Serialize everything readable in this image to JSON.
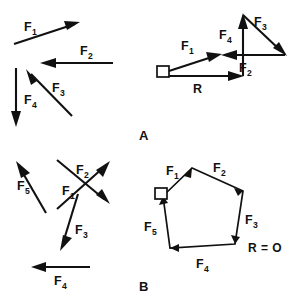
{
  "figure": {
    "panels": [
      {
        "id": "A",
        "label": "A",
        "caption": "A",
        "description": "Four concurrent force vectors and their tip-to-tail resultant",
        "resultant_label": "R",
        "resultant_value": "R",
        "vectors": [
          {
            "name": "F",
            "subscript": "1",
            "label": "F",
            "sub": "1"
          },
          {
            "name": "F",
            "subscript": "2",
            "label": "F",
            "sub": "2"
          },
          {
            "name": "F",
            "subscript": "3",
            "label": "F",
            "sub": "3"
          },
          {
            "name": "F",
            "subscript": "4",
            "label": "F",
            "sub": "4"
          }
        ]
      },
      {
        "id": "B",
        "label": "B",
        "caption": "B",
        "description": "Five force vectors forming a closed polygon, zero resultant",
        "resultant_label": "R = O",
        "resultant_value": "R = O",
        "vectors": [
          {
            "name": "F",
            "subscript": "1",
            "label": "F",
            "sub": "1"
          },
          {
            "name": "F",
            "subscript": "2",
            "label": "F",
            "sub": "2"
          },
          {
            "name": "F",
            "subscript": "3",
            "label": "F",
            "sub": "3"
          },
          {
            "name": "F",
            "subscript": "4",
            "label": "F",
            "sub": "4"
          },
          {
            "name": "F",
            "subscript": "5",
            "label": "F",
            "sub": "5"
          }
        ]
      }
    ],
    "labels": {
      "f1": "F",
      "f1_sub": "1",
      "f2": "F",
      "f2_sub": "2",
      "f3": "F",
      "f3_sub": "3",
      "f4": "F",
      "f4_sub": "4",
      "f5": "F",
      "f5_sub": "5",
      "r": "R",
      "r_zero": "R = O",
      "panel_a": "A",
      "panel_b": "B"
    },
    "colors": {
      "stroke": "#111111",
      "background": "#ffffff"
    }
  }
}
